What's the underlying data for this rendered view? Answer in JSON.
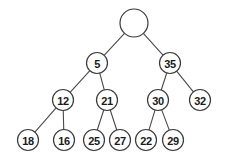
{
  "figure": {
    "background_color": "#ffffff",
    "node_fill": "#ffffff",
    "node_stroke": "#3a3a3a",
    "edge_stroke": "#4a4a4a",
    "label_color": "#1a1a1a",
    "width": 229,
    "height": 162
  },
  "chart_data": {
    "type": "diagram",
    "subtype": "binary-tree",
    "levels": 4,
    "node_count": 13,
    "nodes": [
      {
        "id": "root",
        "label": "",
        "x": 134,
        "y": 23,
        "r": 14,
        "level": 1
      },
      {
        "id": "n5",
        "label": "5",
        "x": 97,
        "y": 63,
        "r": 10.5,
        "level": 2
      },
      {
        "id": "n35",
        "label": "35",
        "x": 170,
        "y": 63,
        "r": 10.5,
        "level": 2
      },
      {
        "id": "n12",
        "label": "12",
        "x": 63,
        "y": 100,
        "r": 10.5,
        "level": 3
      },
      {
        "id": "n21",
        "label": "21",
        "x": 107,
        "y": 100,
        "r": 10.5,
        "level": 3
      },
      {
        "id": "n30",
        "label": "30",
        "x": 158,
        "y": 100,
        "r": 10.5,
        "level": 3
      },
      {
        "id": "n32",
        "label": "32",
        "x": 200,
        "y": 100,
        "r": 10.5,
        "level": 3
      },
      {
        "id": "n18",
        "label": "18",
        "x": 28,
        "y": 140,
        "r": 10.5,
        "level": 4
      },
      {
        "id": "n16",
        "label": "16",
        "x": 64,
        "y": 140,
        "r": 10.5,
        "level": 4
      },
      {
        "id": "n25",
        "label": "25",
        "x": 94,
        "y": 140,
        "r": 10.5,
        "level": 4
      },
      {
        "id": "n27",
        "label": "27",
        "x": 120,
        "y": 140,
        "r": 10.5,
        "level": 4
      },
      {
        "id": "n22",
        "label": "22",
        "x": 146,
        "y": 140,
        "r": 10.5,
        "level": 4
      },
      {
        "id": "n29",
        "label": "29",
        "x": 173,
        "y": 140,
        "r": 10.5,
        "level": 4
      }
    ],
    "edges": [
      {
        "from": "root",
        "to": "n5",
        "side": "left"
      },
      {
        "from": "root",
        "to": "n35",
        "side": "right"
      },
      {
        "from": "n5",
        "to": "n12",
        "side": "left"
      },
      {
        "from": "n5",
        "to": "n21",
        "side": "right"
      },
      {
        "from": "n35",
        "to": "n30",
        "side": "left"
      },
      {
        "from": "n35",
        "to": "n32",
        "side": "right"
      },
      {
        "from": "n12",
        "to": "n18",
        "side": "left"
      },
      {
        "from": "n12",
        "to": "n16",
        "side": "right"
      },
      {
        "from": "n21",
        "to": "n25",
        "side": "left"
      },
      {
        "from": "n21",
        "to": "n27",
        "side": "right"
      },
      {
        "from": "n30",
        "to": "n22",
        "side": "left"
      },
      {
        "from": "n30",
        "to": "n29",
        "side": "right"
      }
    ]
  }
}
